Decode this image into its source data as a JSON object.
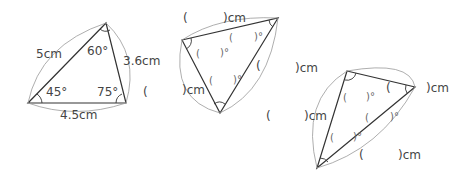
{
  "triangles": [
    {
      "id": "given",
      "sides": {
        "left": "5cm",
        "right": "3.6cm",
        "bottom": "4.5cm"
      },
      "angles": {
        "top": "60°",
        "bottom_left": "45°",
        "bottom_right": "75°"
      },
      "stray": "("
    },
    {
      "id": "rotated-1",
      "sides": {
        "top_open": "(",
        "top_close": ")cm",
        "left_close": ")cm",
        "right_open": "(",
        "right_close": ")cm"
      },
      "angles": {
        "a_open": "(",
        "a_close": ")°",
        "b_open": "(",
        "b_close": ")°",
        "c_open": "(",
        "c_close": ")°"
      }
    },
    {
      "id": "rotated-2",
      "sides": {
        "left_open": "(",
        "left_close": ")cm",
        "right_open": "(",
        "right_close": ")cm",
        "bottom_open": "(",
        "bottom_close": ")cm"
      },
      "angles": {
        "a_open": "(",
        "a_close": ")°",
        "b_open": "(",
        "b_close": ")°",
        "c_open": "(",
        "c_close": ")°"
      }
    }
  ]
}
